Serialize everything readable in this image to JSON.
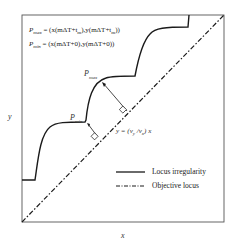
{
  "figure": {
    "formulas": {
      "p_max": "P_max = (x(mΔT+t_m), y(mΔT+t_m))",
      "p_min": "P_min = (x(mΔT+0), y(mΔT+0))",
      "p_max_lhs_main": "P",
      "p_max_lhs_sub": "max",
      "p_max_rhs": " = (x(mΔT+t",
      "p_max_rhs_sub": "m",
      "p_max_rhs_mid": "),y(mΔT+t",
      "p_max_rhs_end": "))",
      "p_min_lhs_main": "P",
      "p_min_lhs_sub": "min",
      "p_min_rhs": " = (x(mΔT+0),y(mΔT+0))"
    },
    "annotations": {
      "p_max_label": "P",
      "p_max_sub": "max",
      "p_min_label": "P",
      "p_min_sub": "min",
      "line_eq_pre": "y = (v",
      "line_eq_sub1": "y",
      "line_eq_mid": " /v",
      "line_eq_sub2": "x",
      "line_eq_post": ") x"
    },
    "axes": {
      "x_label": "x",
      "y_label": "y"
    },
    "legend": {
      "items": [
        {
          "label": "Locus irregularity",
          "style": "solid"
        },
        {
          "label": "Objective locus",
          "style": "dash-dot"
        }
      ]
    },
    "colors": {
      "line": "#1a1a1a",
      "frame": "#555555",
      "background": "#ffffff"
    }
  }
}
